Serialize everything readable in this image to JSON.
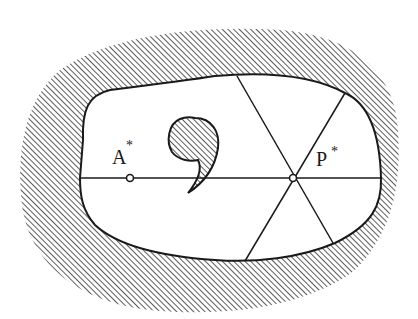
{
  "diagram": {
    "labels": {
      "a": {
        "text": "A",
        "superscript": "*"
      },
      "p": {
        "text": "P",
        "superscript": "*"
      }
    },
    "colors": {
      "ink": "#1a1a1a",
      "background": "#ffffff"
    }
  }
}
